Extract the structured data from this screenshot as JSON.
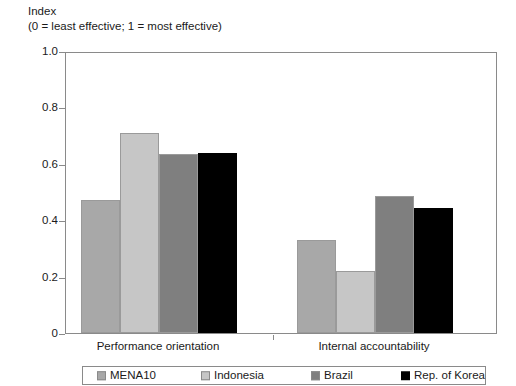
{
  "axis_title": {
    "line1": "Index",
    "line2": "(0 = least effective; 1 = most effective)"
  },
  "yaxis": {
    "ticks": [
      "1.0",
      "0.8",
      "0.6",
      "0.4",
      "0.2",
      "0"
    ]
  },
  "legend": {
    "items": [
      {
        "label": "MENA10",
        "color": "#a8a8a8"
      },
      {
        "label": "Indonesia",
        "color": "#c6c6c6"
      },
      {
        "label": "Brazil",
        "color": "#7f7f7f"
      },
      {
        "label": "Rep. of Korea",
        "color": "#000000"
      }
    ]
  },
  "categories": [
    "Performance orientation",
    "Internal accountability"
  ],
  "chart_data": {
    "type": "bar",
    "title": "Index",
    "subtitle": "(0 = least effective; 1 = most effective)",
    "xlabel": "",
    "ylabel": "Index",
    "ylim": [
      0,
      1.0
    ],
    "yticks": [
      0,
      0.2,
      0.4,
      0.6,
      0.8,
      1.0
    ],
    "grid": false,
    "legend_position": "bottom",
    "categories": [
      "Performance orientation",
      "Internal accountability"
    ],
    "series": [
      {
        "name": "MENA10",
        "color": "#a8a8a8",
        "values": [
          0.47,
          0.33
        ]
      },
      {
        "name": "Indonesia",
        "color": "#c6c6c6",
        "values": [
          0.71,
          0.22
        ]
      },
      {
        "name": "Brazil",
        "color": "#7f7f7f",
        "values": [
          0.635,
          0.485
        ]
      },
      {
        "name": "Rep. of Korea",
        "color": "#000000",
        "values": [
          0.64,
          0.445
        ]
      }
    ]
  }
}
